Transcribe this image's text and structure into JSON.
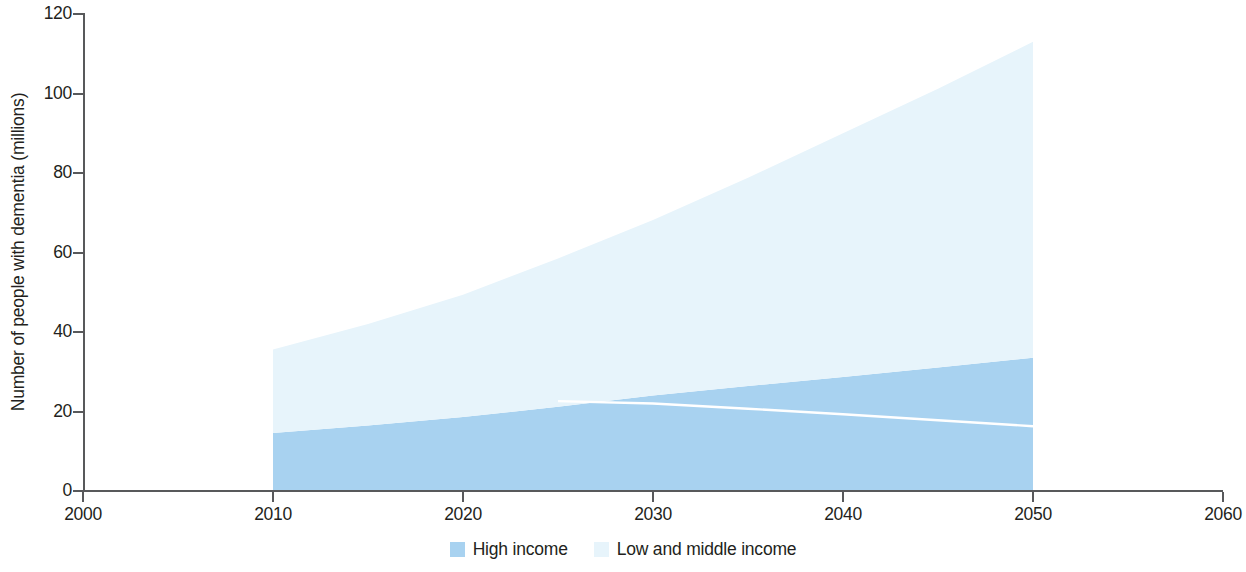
{
  "chart_data": {
    "type": "area",
    "title": "",
    "subtitle": "",
    "xlabel": "",
    "ylabel": "Number of people with dementia (millions)",
    "x": [
      2010,
      2015,
      2020,
      2025,
      2030,
      2035,
      2040,
      2045,
      2050
    ],
    "xlim": [
      2000,
      2060
    ],
    "ylim": [
      0,
      120
    ],
    "xticks": [
      2000,
      2010,
      2020,
      2030,
      2040,
      2050,
      2060
    ],
    "yticks": [
      0,
      20,
      40,
      60,
      80,
      100,
      120
    ],
    "xtick_labels": [
      "2000",
      "2010",
      "2020",
      "2030",
      "2040",
      "2050",
      "2060"
    ],
    "ytick_labels": [
      "0",
      "20",
      "40",
      "60",
      "80",
      "100",
      "120"
    ],
    "grid": false,
    "legend_position": "bottom",
    "stacked": true,
    "series": [
      {
        "name": "High income",
        "color": "#a8d2f0",
        "values": [
          14.6,
          16.5,
          18.6,
          21.2,
          24.0,
          26.4,
          28.7,
          31.1,
          33.5
        ]
      },
      {
        "name": "Low and middle income",
        "color": "#e7f4fb",
        "values": [
          21.0,
          25.5,
          30.8,
          37.3,
          44.2,
          52.4,
          61.3,
          70.1,
          79.5
        ]
      }
    ],
    "totals": [
      35.6,
      42.0,
      49.4,
      58.5,
      68.2,
      78.8,
      90.0,
      101.2,
      113.0
    ],
    "overlay_line": {
      "name": "high-income-trend",
      "color": "#ffffff",
      "x": [
        2025,
        2030,
        2035,
        2040,
        2045,
        2050
      ],
      "values": [
        22.6,
        22.0,
        20.7,
        19.3,
        17.8,
        16.3
      ]
    }
  },
  "axes": {
    "y_title": "Number of people with dementia (millions)",
    "y_ticks": [
      "0",
      "20",
      "40",
      "60",
      "80",
      "100",
      "120"
    ],
    "x_ticks": [
      "2000",
      "2010",
      "2020",
      "2030",
      "2040",
      "2050",
      "2060"
    ]
  },
  "legend": {
    "items": [
      {
        "label": "High income",
        "color": "#a8d2f0"
      },
      {
        "label": "Low and middle income",
        "color": "#e7f4fb"
      }
    ]
  },
  "colors": {
    "high_income": "#a8d2f0",
    "low_middle_income": "#e7f4fb",
    "axis": "#58595b",
    "text": "#231f20",
    "overlay_line": "#ffffff",
    "background": "#ffffff"
  }
}
